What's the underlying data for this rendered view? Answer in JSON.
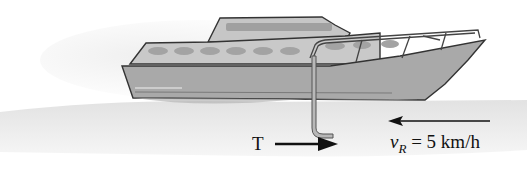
{
  "figure": {
    "type": "physics-diagram",
    "labels": {
      "thrust": "T",
      "velocity_symbol": "v",
      "velocity_subscript": "R",
      "velocity_value": " = 5 km/h"
    },
    "arrows": [
      {
        "name": "thrust-arrow",
        "direction": "right",
        "label": "T"
      },
      {
        "name": "relative-velocity-arrow",
        "direction": "left",
        "label": "v_R = 5 km/h"
      }
    ],
    "colors": {
      "background": "#ffffff",
      "water": "#e8e8e8",
      "hull": "#a8a8a8",
      "cabin": "#c4c4c4",
      "windows": "#9a9a9a",
      "outline": "#333333",
      "arrow": "#111111"
    }
  }
}
